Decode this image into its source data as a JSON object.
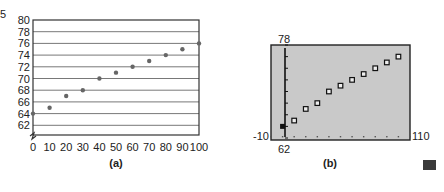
{
  "chart_data": [
    {
      "type": "scatter",
      "caption": "(a)",
      "x": [
        0,
        10,
        20,
        30,
        40,
        50,
        60,
        70,
        80,
        90,
        100
      ],
      "y": [
        64,
        65,
        67,
        68,
        70,
        71,
        72,
        73,
        74,
        75,
        76
      ],
      "x_ticks": [
        "0",
        "10",
        "20",
        "30",
        "40",
        "50",
        "60",
        "70",
        "80",
        "90",
        "100"
      ],
      "y_ticks": [
        "62",
        "64",
        "66",
        "68",
        "70",
        "72",
        "74",
        "76",
        "78",
        "80"
      ],
      "xlim": [
        0,
        100
      ],
      "ylim": [
        60,
        80
      ],
      "grid": "horizontal",
      "axis_break": "y",
      "xlabel": "",
      "ylabel": ""
    },
    {
      "type": "scatter",
      "caption": "(b)",
      "style": "graphing-calculator-screen",
      "x": [
        0,
        10,
        20,
        30,
        40,
        50,
        60,
        70,
        80,
        90,
        100
      ],
      "y": [
        64,
        65,
        67,
        68,
        70,
        71,
        72,
        73,
        74,
        75,
        76
      ],
      "window": {
        "xmin": "-10",
        "xmax": "110",
        "ymin": "62",
        "ymax": "78"
      },
      "xlabel": "",
      "ylabel": ""
    }
  ],
  "ui": {
    "corner_mark": "5",
    "end_marker_color": "#3a3a3a"
  }
}
